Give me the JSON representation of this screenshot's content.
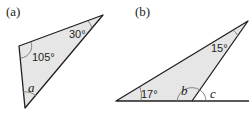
{
  "figure": {
    "panel_a": {
      "label": "(a)",
      "angles": {
        "top": "30°",
        "left": "105°",
        "bottom": "a"
      }
    },
    "panel_b": {
      "label": "(b)",
      "angles": {
        "left": "17°",
        "apex": "15°",
        "interior": "b",
        "exterior": "c"
      }
    },
    "colors": {
      "fill": "#e6e6e6",
      "stroke": "#231f20"
    }
  }
}
